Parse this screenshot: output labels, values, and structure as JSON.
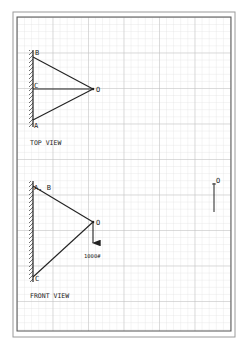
{
  "diagram": {
    "type": "engineering-statics-sketch",
    "paper": "graph paper",
    "colors": {
      "line": "#222222",
      "grid_minor": "#d6d6d6",
      "grid_major": "#b8b8b8",
      "frame": "#8a8a8a",
      "background": "#ffffff"
    },
    "top_view": {
      "caption": "TOP VIEW",
      "points": {
        "B": {
          "label": "B",
          "x": 33,
          "y": 57
        },
        "C": {
          "label": "C",
          "x": 33,
          "y": 89
        },
        "A": {
          "label": "A",
          "x": 33,
          "y": 120
        },
        "O": {
          "label": "O",
          "x": 93,
          "y": 89
        }
      },
      "members": [
        "B-O",
        "C-O",
        "A-O"
      ],
      "wall": {
        "x": 33,
        "y1": 50,
        "y2": 127
      }
    },
    "front_view": {
      "caption": "FRONT VIEW",
      "points": {
        "AB": {
          "label": "A, B",
          "x": 33,
          "y": 186
        },
        "C": {
          "label": "C",
          "x": 33,
          "y": 277
        },
        "O": {
          "label": "O",
          "x": 93,
          "y": 222
        }
      },
      "members": [
        "AB-O",
        "C-O"
      ],
      "wall": {
        "x": 33,
        "y1": 181,
        "y2": 282
      },
      "load": {
        "label": "1000#",
        "value": 1000,
        "unit": "lb",
        "direction": "down"
      }
    },
    "side_view": {
      "points": {
        "O": {
          "label": "O",
          "x": 214,
          "y": 183
        }
      },
      "member_end_y": 212
    }
  }
}
